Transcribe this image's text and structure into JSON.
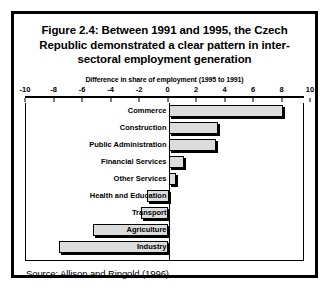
{
  "figure": {
    "title_lines": [
      "Figure 2.4: Between 1991 and 1995, the Czech",
      "Republic demonstrated a clear pattern in inter-",
      "sectoral employment generation"
    ],
    "source": "Source:  Allison and Ringold (1996)."
  },
  "chart_data": {
    "type": "bar",
    "orientation": "horizontal",
    "xlabel": "Difference in share of employment (1995 to 1991)",
    "ylabel": "",
    "xlim": [
      -10,
      10
    ],
    "xticks": [
      -10,
      -8,
      -6,
      -4,
      -2,
      0,
      2,
      4,
      6,
      8,
      10
    ],
    "xtick_labels": [
      "-10",
      "-8",
      "-6",
      "-4",
      "-2",
      "0",
      "2",
      "4",
      "6",
      "8",
      "10"
    ],
    "grid": false,
    "legend": null,
    "categories": [
      "Commerce",
      "Construction",
      "Public Administration",
      "Financial Services",
      "Other Services",
      "Health and Education",
      "Transport",
      "Agriculture",
      "Industry"
    ],
    "values": [
      8.0,
      3.5,
      3.3,
      1.1,
      0.5,
      -1.5,
      -1.9,
      -5.3,
      -7.7
    ],
    "bar_color": "#dcdcdc",
    "bar_edge_color": "#000000"
  }
}
